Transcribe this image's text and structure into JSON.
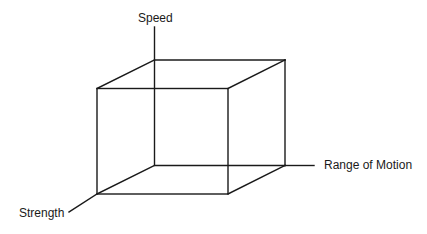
{
  "diagram": {
    "type": "3d-cube-axes",
    "axes": {
      "vertical": "Speed",
      "horizontal": "Range of Motion",
      "depth": "Strength"
    },
    "line_color": "#1a1a1a",
    "background": "#ffffff"
  }
}
